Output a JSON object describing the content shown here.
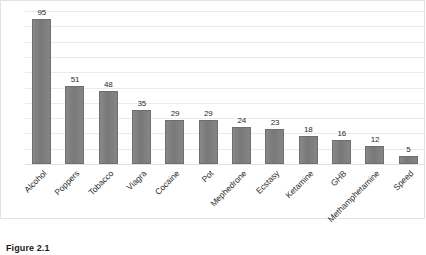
{
  "caption": "Figure 2.1",
  "chart_data": {
    "type": "bar",
    "title": "",
    "subtitle": "",
    "xlabel": "",
    "ylabel": "",
    "ylim": [
      0,
      100
    ],
    "ytick_step": 10,
    "yticks": [
      "100",
      "90",
      "80",
      "70",
      "60",
      "50",
      "40",
      "30",
      "20",
      "10",
      "0"
    ],
    "grid": true,
    "legend": false,
    "legend_position": "none",
    "bar_color": "#7f7f7f",
    "bar_border_color": "#6e6e6e",
    "gridline_color": "#eaeaea",
    "show_data_labels": true,
    "xtick_rotation": -45,
    "categories": [
      "Alcohol",
      "Poppers",
      "Tobacco",
      "Viagra",
      "Cocaine",
      "Pot",
      "Mephedrone",
      "Ecstasy",
      "Ketamine",
      "GHB",
      "Methamphetamine",
      "Speed"
    ],
    "values": [
      95,
      51,
      48,
      35,
      29,
      29,
      24,
      23,
      18,
      16,
      12,
      5
    ],
    "value_labels": [
      "95",
      "51",
      "48",
      "35",
      "29",
      "29",
      "24",
      "23",
      "18",
      "16",
      "12",
      "5"
    ]
  }
}
